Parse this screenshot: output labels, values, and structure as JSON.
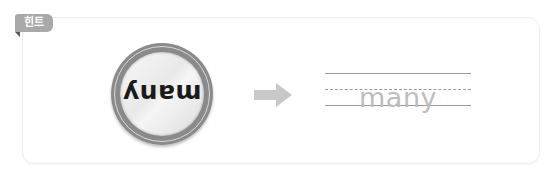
{
  "hint_badge": {
    "label": "힌트",
    "color": "#a9a9a9"
  },
  "coin": {
    "word": "many",
    "orientation": "rotated-180"
  },
  "arrow": {
    "icon": "arrow-right-icon",
    "color": "#c8c8c8"
  },
  "trace_guide": {
    "word": "many",
    "text_color": "#bdbdbd",
    "lines": [
      "solid",
      "dashed",
      "solid"
    ]
  }
}
